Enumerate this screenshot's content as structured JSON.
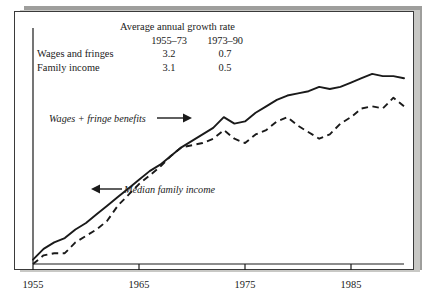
{
  "figure": {
    "name": "growth-of-wages-and-family-income"
  },
  "growth_table": {
    "title": "Average annual growth rate",
    "columns": [
      "1955–73",
      "1973–90"
    ],
    "rows": [
      {
        "label": "Wages and fringes",
        "values": [
          "3.2",
          "0.7"
        ]
      },
      {
        "label": "Family income",
        "values": [
          "3.1",
          "0.5"
        ]
      }
    ]
  },
  "annotations": [
    {
      "id": "wages",
      "text": "Wages + fringe benefits",
      "arrow": "right"
    },
    {
      "id": "income",
      "text": "Median family income",
      "arrow": "left"
    }
  ],
  "axis": {
    "x_ticks": [
      "1955",
      "1965",
      "1975",
      "1985"
    ]
  },
  "colors": {
    "ink": "#1a1a1a",
    "frame": "#3a3a3a",
    "shadow": "#9e9e9c",
    "paper": "#ffffff"
  },
  "chart_data": {
    "type": "line",
    "title": "",
    "xlabel": "",
    "ylabel": "",
    "xlim": [
      1955,
      1990
    ],
    "ylim": [
      0,
      100
    ],
    "grid": false,
    "legend": "inline-annotations",
    "x": [
      1955,
      1956,
      1957,
      1958,
      1959,
      1960,
      1961,
      1962,
      1963,
      1964,
      1965,
      1966,
      1967,
      1968,
      1969,
      1970,
      1971,
      1972,
      1973,
      1974,
      1975,
      1976,
      1977,
      1978,
      1979,
      1980,
      1981,
      1982,
      1983,
      1984,
      1985,
      1986,
      1987,
      1988,
      1989,
      1990
    ],
    "series": [
      {
        "name": "Wages + fringe benefits",
        "style": "solid",
        "growth_1955_73": 3.2,
        "growth_1973_90": 0.7,
        "values": [
          2,
          7,
          10,
          12,
          16,
          19,
          23,
          27,
          31,
          35,
          39,
          43,
          46,
          50,
          54,
          57,
          60,
          63,
          68,
          65,
          66,
          70,
          73,
          76,
          78,
          79,
          80,
          82,
          81,
          82,
          84,
          86,
          88,
          87,
          87,
          86
        ]
      },
      {
        "name": "Median family income",
        "style": "dashed",
        "growth_1955_73": 3.1,
        "growth_1973_90": 0.5,
        "values": [
          0,
          4,
          5,
          5,
          10,
          13,
          16,
          20,
          27,
          32,
          37,
          41,
          45,
          50,
          54,
          55,
          56,
          58,
          62,
          58,
          56,
          60,
          62,
          66,
          68,
          64,
          61,
          58,
          60,
          65,
          68,
          72,
          73,
          72,
          77,
          73
        ]
      }
    ]
  }
}
